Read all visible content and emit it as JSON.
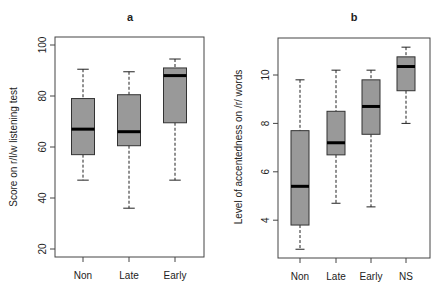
{
  "chart_data": [
    {
      "type": "box",
      "title": "a",
      "xlabel": "",
      "ylabel": "Score on r/l/w listening test",
      "categories": [
        "Non",
        "Late",
        "Early"
      ],
      "yticks": [
        20,
        40,
        60,
        80,
        100
      ],
      "ylim": [
        17,
        102
      ],
      "grid": false,
      "series": [
        {
          "name": "Non",
          "whisker_low": 47,
          "q1": 57,
          "median": 67,
          "q3": 79,
          "whisker_high": 90.5
        },
        {
          "name": "Late",
          "whisker_low": 36,
          "q1": 60.5,
          "median": 66,
          "q3": 80.5,
          "whisker_high": 89.5
        },
        {
          "name": "Early",
          "whisker_low": 47,
          "q1": 69.5,
          "median": 88,
          "q3": 91,
          "whisker_high": 94.5
        }
      ],
      "box_color": "#999999"
    },
    {
      "type": "box",
      "title": "b",
      "xlabel": "",
      "ylabel": "Level of accentedness on /r/ words",
      "categories": [
        "Non",
        "Late",
        "Early",
        "NS"
      ],
      "yticks": [
        4,
        6,
        8,
        10
      ],
      "ylim": [
        2.5,
        11.5
      ],
      "grid": false,
      "series": [
        {
          "name": "Non",
          "whisker_low": 2.8,
          "q1": 3.8,
          "median": 5.4,
          "q3": 7.7,
          "whisker_high": 9.8
        },
        {
          "name": "Late",
          "whisker_low": 4.7,
          "q1": 6.7,
          "median": 7.2,
          "q3": 8.5,
          "whisker_high": 10.2
        },
        {
          "name": "Early",
          "whisker_low": 4.55,
          "q1": 7.55,
          "median": 8.7,
          "q3": 9.8,
          "whisker_high": 10.2
        },
        {
          "name": "NS",
          "whisker_low": 8.0,
          "q1": 9.35,
          "median": 10.35,
          "q3": 10.75,
          "whisker_high": 11.15
        }
      ],
      "box_color": "#999999"
    }
  ]
}
